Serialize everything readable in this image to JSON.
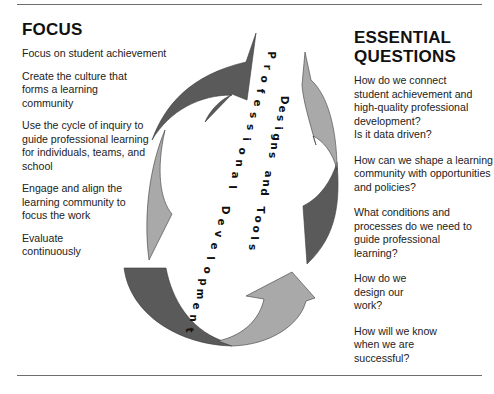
{
  "focus": {
    "heading": "FOCUS",
    "items": [
      "Focus on student achievement",
      "Create the culture that forms a learning community",
      "Use the cycle of inquiry to guide professional learning for individuals, teams, and school",
      "Engage and align the learning community to focus the work",
      "Evaluate continuously"
    ]
  },
  "questions": {
    "heading": "ESSENTIAL QUESTIONS",
    "items": [
      "How do we connect student achievement and high-quality professional development?\nIs it data driven?",
      "How can we shape a learning community with opportunities and policies?",
      "What conditions and processes do we need to guide professional learning?",
      "How do we design our work?",
      "How will we know when we are successful?"
    ]
  },
  "cycle": {
    "outer_label": "Professional Development",
    "inner_label": "Designs and Tools",
    "colors": {
      "dark_arrow": "#5a5a5a",
      "light_arrow": "#a9a9a9",
      "outline": "#3a3a3a"
    }
  }
}
